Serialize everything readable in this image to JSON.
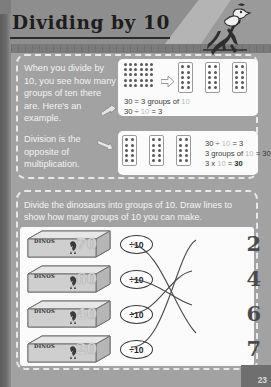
{
  "page": {
    "title": "Dividing by 10",
    "page_number": "23",
    "mascot_icon": "dinosaur-mascot-icon"
  },
  "explanation": {
    "paragraph_1": "When you divide by 10, you see how many groups of ten there are. Here's an example.",
    "paragraph_2": "Division is the opposite of multiplication.",
    "example_1": {
      "total_dots": 30,
      "group_size": 10,
      "groups": 3,
      "line_1_a": "30 = 3 groups of ",
      "line_1_b": "10",
      "line_2_a": "30 ÷ ",
      "line_2_b": "10",
      "line_2_c": " = 3"
    },
    "example_2": {
      "line_1_a": "30 ÷ ",
      "line_1_b": "10",
      "line_1_c": " = 3",
      "line_2_a": "3 groups of ",
      "line_2_b": "10",
      "line_2_c": " = 30",
      "line_3_a": "3 x ",
      "line_3_b": "10",
      "line_3_c": " = ",
      "line_3_d": "30"
    }
  },
  "activity": {
    "instruction": "Divide the dinosaurs into groups of 10.  Draw lines to show how many groups of 10 you can make.",
    "box_label": "DINOS",
    "operator_label": "÷10",
    "boxes": [
      {
        "quantity": "70",
        "answer_index": 3
      },
      {
        "quantity": "60",
        "answer_index": 2
      },
      {
        "quantity": "40",
        "answer_index": 1
      },
      {
        "quantity": "20",
        "answer_index": 0
      }
    ],
    "answers": [
      "2",
      "4",
      "6",
      "7"
    ]
  }
}
